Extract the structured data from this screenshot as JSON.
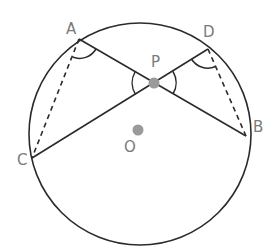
{
  "diagram": {
    "type": "circle-geometry",
    "colors": {
      "stroke": "#2b2b2b",
      "label": "#7a7a7a",
      "point_fill": "#9a9a9a"
    },
    "circle": {
      "center": "O",
      "cx": 140,
      "cy": 134,
      "r": 111
    },
    "points": {
      "A": {
        "label": "A",
        "x": 79,
        "y": 39,
        "on_circle": true
      },
      "B": {
        "label": "B",
        "x": 246,
        "y": 136,
        "on_circle": true
      },
      "C": {
        "label": "C",
        "x": 32,
        "y": 158,
        "on_circle": true
      },
      "D": {
        "label": "D",
        "x": 208,
        "y": 49,
        "on_circle": true
      },
      "P": {
        "label": "P",
        "x": 154,
        "y": 83,
        "on_circle": false
      },
      "O": {
        "label": "O",
        "x": 137,
        "y": 131,
        "on_circle": false
      }
    },
    "segments": [
      {
        "from": "A",
        "to": "B",
        "style": "solid",
        "note": "chord AB passes through P"
      },
      {
        "from": "C",
        "to": "D",
        "style": "solid",
        "note": "chord CD passes through P"
      },
      {
        "from": "A",
        "to": "C",
        "style": "dashed"
      },
      {
        "from": "D",
        "to": "B",
        "style": "dashed"
      }
    ],
    "angle_marks": [
      {
        "vertex": "A",
        "between": [
          "C",
          "P"
        ]
      },
      {
        "vertex": "D",
        "between": [
          "P",
          "B"
        ]
      },
      {
        "vertex": "P",
        "between": [
          "A",
          "C"
        ]
      },
      {
        "vertex": "P",
        "between": [
          "D",
          "B"
        ]
      }
    ]
  }
}
